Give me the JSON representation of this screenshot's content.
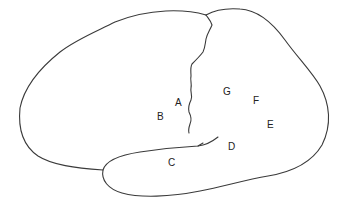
{
  "diagram": {
    "stroke_color": "#3a3a3a",
    "label_color": "#222222",
    "labels": {
      "A": "A",
      "B": "B",
      "C": "C",
      "D": "D",
      "E": "E",
      "F": "F",
      "G": "G"
    }
  }
}
